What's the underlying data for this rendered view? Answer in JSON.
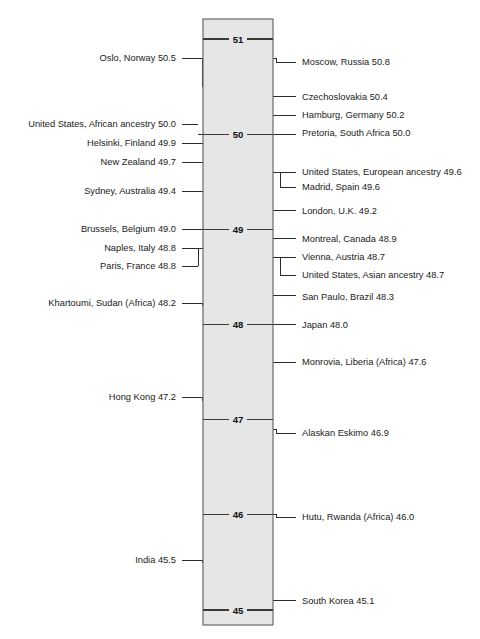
{
  "figure": {
    "title": "",
    "axis_label": ""
  },
  "chart_data": {
    "type": "scatter",
    "orientation": "vertical-axis-strip",
    "title": "",
    "subtitle": "",
    "xlabel": "",
    "ylabel": "",
    "ylim": [
      45,
      51
    ],
    "grid": false,
    "legend": null,
    "axis_ticks": [
      {
        "value": 51,
        "label": "51"
      },
      {
        "value": 50,
        "label": "50"
      },
      {
        "value": 49,
        "label": "49"
      },
      {
        "value": 48,
        "label": "48"
      },
      {
        "value": 47,
        "label": "47"
      },
      {
        "value": 46,
        "label": "46"
      },
      {
        "value": 45,
        "label": "45"
      }
    ],
    "categories": [
      "Moscow, Russia",
      "Oslo, Norway",
      "Czechoslovakia",
      "Hamburg, Germany",
      "United States, African ancestry",
      "Pretoria, South Africa",
      "Helsinki, Finland",
      "New Zealand",
      "United States, European ancestry",
      "Madrid, Spain",
      "Sydney, Australia",
      "London, U.K.",
      "Brussels, Belgium",
      "Montreal, Canada",
      "Naples, Italy",
      "Vienna, Austria",
      "United States, Asian ancestry",
      "Paris, France",
      "San Paulo, Brazil",
      "Khartoumi, Sudan (Africa)",
      "Japan",
      "Monrovia, Liberia (Africa)",
      "Hong Kong",
      "Alaskan Eskimo",
      "Hutu, Rwanda (Africa)",
      "India",
      "South Korea"
    ],
    "values": [
      50.8,
      50.5,
      50.4,
      50.2,
      50.0,
      50.0,
      49.9,
      49.7,
      49.6,
      49.6,
      49.4,
      49.2,
      49.0,
      48.9,
      48.8,
      48.7,
      48.7,
      48.8,
      48.3,
      48.2,
      48.0,
      47.6,
      47.2,
      46.9,
      46.0,
      45.5,
      45.1
    ]
  },
  "left_labels": [
    {
      "text": "Oslo, Norway 50.5",
      "value": 50.5,
      "group": null
    },
    {
      "text": "United States, African ancestry 50.0",
      "value": 50.0,
      "group": "g-left-50"
    },
    {
      "text": "Helsinki, Finland 49.9",
      "value": 49.9,
      "group": null
    },
    {
      "text": "New Zealand 49.7",
      "value": 49.7,
      "group": null
    },
    {
      "text": "Sydney, Australia 49.4",
      "value": 49.4,
      "group": null
    },
    {
      "text": "Brussels, Belgium 49.0",
      "value": 49.0,
      "group": null
    },
    {
      "text": "Naples, Italy 48.8",
      "value": 48.8,
      "group": "g-left-488"
    },
    {
      "text": "Paris, France 48.8",
      "value": 48.8,
      "group": "g-left-488"
    },
    {
      "text": "Khartoumi, Sudan (Africa) 48.2",
      "value": 48.2,
      "group": null
    },
    {
      "text": "Hong Kong 47.2",
      "value": 47.2,
      "group": null
    },
    {
      "text": "India 45.5",
      "value": 45.5,
      "group": null
    }
  ],
  "right_labels": [
    {
      "text": "Moscow, Russia 50.8",
      "value": 50.8,
      "group": null
    },
    {
      "text": "Czechoslovakia 50.4",
      "value": 50.4,
      "group": null
    },
    {
      "text": "Hamburg, Germany 50.2",
      "value": 50.2,
      "group": null
    },
    {
      "text": "Pretoria, South Africa 50.0",
      "value": 50.0,
      "group": null
    },
    {
      "text": "United States, European ancestry 49.6",
      "value": 49.6,
      "group": "g-right-496"
    },
    {
      "text": "Madrid, Spain 49.6",
      "value": 49.6,
      "group": "g-right-496"
    },
    {
      "text": "London, U.K. 49.2",
      "value": 49.2,
      "group": null
    },
    {
      "text": "Montreal, Canada 48.9",
      "value": 48.9,
      "group": null
    },
    {
      "text": "Vienna, Austria 48.7",
      "value": 48.7,
      "group": "g-right-487"
    },
    {
      "text": "United States, Asian ancestry 48.7",
      "value": 48.7,
      "group": "g-right-487"
    },
    {
      "text": "San Paulo, Brazil 48.3",
      "value": 48.3,
      "group": null
    },
    {
      "text": "Japan 48.0",
      "value": 48.0,
      "group": null
    },
    {
      "text": "Monrovia, Liberia (Africa) 47.6",
      "value": 47.6,
      "group": null
    },
    {
      "text": "Alaskan Eskimo 46.9",
      "value": 46.9,
      "group": null
    },
    {
      "text": "Hutu, Rwanda (Africa) 46.0",
      "value": 46.0,
      "group": null
    },
    {
      "text": "South Korea 45.1",
      "value": 45.1,
      "group": null
    }
  ],
  "colors": {
    "column_fill": "#e6e6e6",
    "column_stroke": "#6a6a6a",
    "leader_line": "#2b2b2b",
    "tick_line": "#3a3a3a",
    "text": "#1a1a1a",
    "page_background": "#ffffff"
  },
  "geometry": {
    "column_left_px": 203,
    "column_right_px": 273,
    "column_top_px": 19,
    "column_bottom_px": 625,
    "value_top": 51,
    "value_top_px": 39,
    "value_bottom": 45,
    "value_bottom_px": 610
  }
}
